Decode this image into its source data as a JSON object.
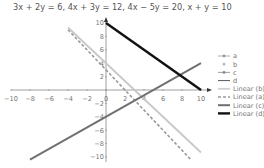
{
  "chart_data": {
    "type": "line",
    "title": "3x + 2y = 6, 4x + 3y = 12, 4x − 5y = 20, x + y = 10",
    "xlabel": "",
    "ylabel": "",
    "xlim": [
      -10,
      10
    ],
    "ylim": [
      -10,
      11
    ],
    "grid": false,
    "legend_position": "right",
    "x_ticks": [
      "−10",
      "−8",
      "−6",
      "−4",
      "−2",
      "0",
      "2",
      "4",
      "6",
      "8",
      "10"
    ],
    "y_ticks": [
      "10",
      "8",
      "6",
      "4",
      "2",
      "−2",
      "−4",
      "−6",
      "−8",
      "−10"
    ],
    "series": [
      {
        "name": "a",
        "equation": "3x + 2y = 6",
        "x": [
          -4,
          9
        ],
        "y": [
          9,
          -10.5
        ],
        "color": "#999999",
        "style": "dashed",
        "trendline": "Linear (a)"
      },
      {
        "name": "b",
        "equation": "4x + 3y = 12",
        "x": [
          -4,
          10
        ],
        "y": [
          9.33,
          -9.33
        ],
        "color": "#c8c8c8",
        "style": "solid",
        "trendline": "Linear (b)"
      },
      {
        "name": "c",
        "equation": "4x − 5y = 20",
        "x": [
          -8,
          10
        ],
        "y": [
          -10.4,
          4
        ],
        "color": "#707070",
        "style": "solid",
        "trendline": "Linear (c)"
      },
      {
        "name": "d",
        "equation": "x + y = 10",
        "x": [
          0,
          10
        ],
        "y": [
          10,
          0
        ],
        "color": "#111111",
        "style": "solid",
        "trendline": "Linear (d)"
      }
    ],
    "legend": [
      "a",
      "b",
      "c",
      "d",
      "Linear (b)",
      "Linear (a)",
      "Linear (c)",
      "Linear (d)"
    ]
  }
}
